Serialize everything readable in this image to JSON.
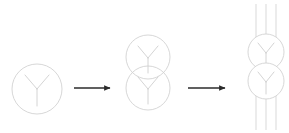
{
  "canvas": {
    "width": 289,
    "height": 133,
    "background": "#ffffff"
  },
  "style": {
    "outline_color": "#cdcdcd",
    "glyph_color": "#c9c9c9",
    "strand_color": "#cfcfcf",
    "arrow_color": "#2b2b2b",
    "outline_width": 0.8,
    "glyph_width": 0.8,
    "strand_width": 0.8,
    "arrow_width": 1.4
  },
  "diagram": {
    "type": "process-flow",
    "title": "",
    "stage_count": 3,
    "arrow_count": 2
  },
  "stages": [
    {
      "id": "stage-1",
      "label": "single-unit",
      "unit_count": 1,
      "strands": false,
      "units": [
        {
          "cx": 37,
          "cy": 89,
          "r": 25,
          "glyph": "y-shape"
        }
      ]
    },
    {
      "id": "stage-2",
      "label": "stacked-pair",
      "unit_count": 2,
      "strands": false,
      "units": [
        {
          "cx": 148,
          "cy": 57,
          "r": 22,
          "glyph": "y-shape"
        },
        {
          "cx": 148,
          "cy": 88,
          "r": 22,
          "glyph": "y-shape"
        }
      ]
    },
    {
      "id": "stage-3",
      "label": "threaded-stack",
      "unit_count": 2,
      "strands": true,
      "strand_x": [
        256,
        266,
        276
      ],
      "strand_y_top": 4,
      "strand_y_bottom": 130,
      "units": [
        {
          "cx": 266,
          "cy": 52,
          "r": 18,
          "glyph": "y-shape"
        },
        {
          "cx": 266,
          "cy": 81,
          "r": 18,
          "glyph": "y-shape"
        }
      ]
    }
  ],
  "arrows": [
    {
      "id": "arrow-1",
      "x1": 74,
      "y1": 88,
      "x2": 113,
      "y2": 88,
      "direction": "right"
    },
    {
      "id": "arrow-2",
      "x1": 188,
      "y1": 88,
      "x2": 228,
      "y2": 88,
      "direction": "right"
    }
  ]
}
